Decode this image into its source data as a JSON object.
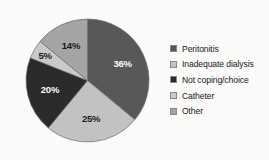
{
  "chart_data": {
    "type": "pie",
    "title": "",
    "subtitle": "",
    "xlabel": "",
    "ylabel": "",
    "legend_position": "right",
    "grid": false,
    "categories": [
      "Peritonitis",
      "Inadequate dialysis",
      "Not coping/choice",
      "Catheter",
      "Other"
    ],
    "values": [
      36,
      25,
      20,
      5,
      14
    ],
    "unit": "%",
    "data_labels": [
      "36%",
      "25%",
      "20%",
      "5%",
      "14%"
    ],
    "colors": [
      "#595959",
      "#c4c4c4",
      "#2b2b2b",
      "#cccccc",
      "#a6a6a6"
    ],
    "label_colors": [
      "#ffffff",
      "#1a1a1a",
      "#ffffff",
      "#1a1a1a",
      "#1a1a1a"
    ],
    "start_angle_deg": 0,
    "direction": "clockwise",
    "slices": [
      {
        "label": "Peritonitis",
        "value": 36,
        "display": "36%",
        "color": "#595959",
        "label_color": "#ffffff"
      },
      {
        "label": "Inadequate dialysis",
        "value": 25,
        "display": "25%",
        "color": "#c4c4c4",
        "label_color": "#1a1a1a"
      },
      {
        "label": "Not coping/choice",
        "value": 20,
        "display": "20%",
        "color": "#2b2b2b",
        "label_color": "#ffffff"
      },
      {
        "label": "Catheter",
        "value": 5,
        "display": "5%",
        "color": "#cccccc",
        "label_color": "#1a1a1a"
      },
      {
        "label": "Other",
        "value": 14,
        "display": "14%",
        "color": "#a6a6a6",
        "label_color": "#1a1a1a"
      }
    ]
  },
  "legend": {
    "items": [
      {
        "label": "Peritonitis",
        "color": "#595959"
      },
      {
        "label": "Inadequate dialysis",
        "color": "#c4c4c4"
      },
      {
        "label": "Not coping/choice",
        "color": "#2b2b2b"
      },
      {
        "label": "Catheter",
        "color": "#cccccc"
      },
      {
        "label": "Other",
        "color": "#a6a6a6"
      }
    ]
  }
}
